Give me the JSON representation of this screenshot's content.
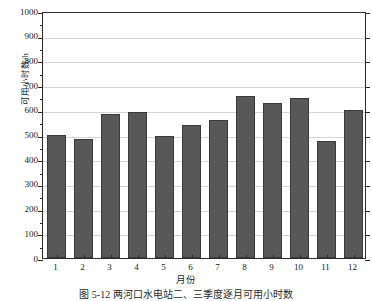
{
  "chart_data": {
    "type": "bar",
    "title": "",
    "xlabel": "月份",
    "ylabel": "可用小时数/h",
    "categories": [
      "1",
      "2",
      "3",
      "4",
      "5",
      "6",
      "7",
      "8",
      "9",
      "10",
      "11",
      "12"
    ],
    "values": [
      497,
      483,
      582,
      592,
      492,
      537,
      559,
      654,
      626,
      649,
      475,
      600
    ],
    "ylim": [
      0,
      1000
    ],
    "yticks": [
      0,
      100,
      200,
      300,
      400,
      500,
      600,
      700,
      800,
      900,
      1000
    ],
    "ytick_labels": [
      "0",
      "100",
      "200",
      "300",
      "400",
      "500",
      "600",
      "700",
      "800",
      "900",
      "1000"
    ],
    "grid": true,
    "grid_axis": "y",
    "legend": null,
    "bar_color": "#585858",
    "bar_edge_color": "#3a3a3a",
    "grid_color": "#d4d4d4",
    "axis_color": "#2b2b2b"
  },
  "caption": "图 5-12  两河口水电站二、三季度逐月可用小时数"
}
